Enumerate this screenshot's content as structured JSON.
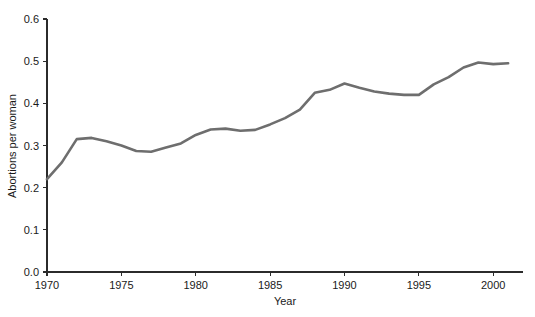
{
  "chart_data": {
    "type": "line",
    "title": "",
    "xlabel": "Year",
    "ylabel": "Abortions per woman",
    "xlim": [
      1970,
      2002
    ],
    "ylim": [
      0.0,
      0.6
    ],
    "grid": false,
    "legend": null,
    "line_color": "#6e6e6e",
    "axis_color": "#2b2b2b",
    "xticks": [
      1970,
      1975,
      1980,
      1985,
      1990,
      1995,
      2000
    ],
    "xtick_labels": [
      "1970",
      "1975",
      "1980",
      "1985",
      "1990",
      "1995",
      "2000"
    ],
    "yticks": [
      0.0,
      0.1,
      0.2,
      0.3,
      0.4,
      0.5,
      0.6
    ],
    "ytick_labels": [
      "0.0",
      "0.1",
      "0.2",
      "0.3",
      "0.4",
      "0.5",
      "0.6"
    ],
    "series": [
      {
        "name": "Abortions per woman",
        "x": [
          1970,
          1971,
          1972,
          1973,
          1974,
          1975,
          1976,
          1977,
          1978,
          1979,
          1980,
          1981,
          1982,
          1983,
          1984,
          1985,
          1986,
          1987,
          1988,
          1989,
          1990,
          1991,
          1992,
          1993,
          1994,
          1995,
          1996,
          1997,
          1998,
          1999,
          2000,
          2001
        ],
        "values": [
          0.22,
          0.26,
          0.315,
          0.318,
          0.31,
          0.3,
          0.287,
          0.285,
          0.295,
          0.305,
          0.325,
          0.338,
          0.34,
          0.335,
          0.337,
          0.35,
          0.365,
          0.385,
          0.425,
          0.432,
          0.447,
          0.437,
          0.428,
          0.423,
          0.42,
          0.42,
          0.445,
          0.462,
          0.485,
          0.497,
          0.493,
          0.495
        ]
      }
    ]
  },
  "axes": {
    "x_label": "Year",
    "y_label": "Abortions per woman"
  }
}
